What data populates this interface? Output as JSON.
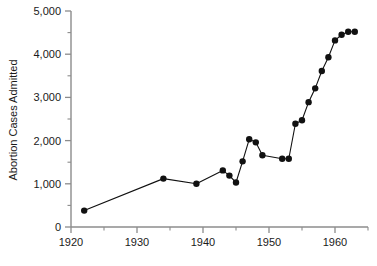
{
  "chart_data": {
    "type": "line",
    "title": "",
    "subtitle": "",
    "xlabel": "",
    "ylabel": "Abortion Cases Admitted",
    "xlim": [
      1920,
      1965
    ],
    "ylim": [
      0,
      5000
    ],
    "grid": false,
    "legend": false,
    "legend_position": "none",
    "x_major_ticks": [
      1920,
      1930,
      1940,
      1950,
      1960
    ],
    "x_major_tick_labels": [
      "1920",
      "1930",
      "1940",
      "1950",
      "1960"
    ],
    "x_minor_ticks": [
      1925,
      1935,
      1945,
      1955,
      1965
    ],
    "y_major_ticks": [
      0,
      1000,
      2000,
      3000,
      4000,
      5000
    ],
    "y_major_tick_labels": [
      "0",
      "1,000",
      "2,000",
      "3,000",
      "4,000",
      "5,000"
    ],
    "y_minor_ticks": [
      500,
      1500,
      2500,
      3500,
      4500
    ],
    "marker": "filled-circle",
    "marker_color": "#111111",
    "line_color": "#111111",
    "series": [
      {
        "name": "Abortion Cases Admitted",
        "x": [
          1922,
          1934,
          1939,
          1943,
          1944,
          1945,
          1946,
          1947,
          1948,
          1949,
          1952,
          1953,
          1954,
          1955,
          1956,
          1957,
          1958,
          1959,
          1960,
          1961,
          1962,
          1963
        ],
        "values": [
          380,
          1120,
          1000,
          1310,
          1190,
          1030,
          1520,
          2030,
          1960,
          1660,
          1580,
          1580,
          2390,
          2470,
          2890,
          3210,
          3610,
          3930,
          4320,
          4450,
          4520,
          4520
        ]
      }
    ]
  },
  "axes": {
    "ylabel": "Abortion Cases Admitted"
  }
}
